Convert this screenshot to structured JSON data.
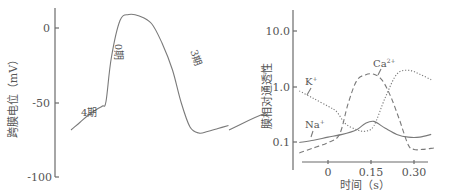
{
  "chart_data": [
    {
      "type": "line",
      "title": "",
      "xlabel": "",
      "ylabel": "跨膜电位（mV）",
      "ylim": [
        -100,
        10
      ],
      "yticks": [
        0,
        -50,
        -100
      ],
      "ytick_labels": [
        "0",
        "-50",
        "-100"
      ],
      "grid": false,
      "series": [
        {
          "name": "action-potential",
          "style": "solid",
          "x": [
            0,
            0.5,
            1,
            1.5,
            1.8,
            2.0,
            2.3,
            2.8,
            3.3,
            3.9,
            4.6,
            5.2,
            5.8,
            6.3,
            6.8,
            7.3,
            7.8,
            8.4,
            9.0
          ],
          "values": [
            -68,
            -63,
            -58,
            -54,
            -52,
            -49,
            -20,
            5,
            9,
            8,
            3,
            -10,
            -28,
            -50,
            -66,
            -70,
            -69,
            -67,
            -65
          ]
        }
      ],
      "annotations": [
        {
          "text": "4期",
          "near": "phase-4 diastolic depolarization"
        },
        {
          "text": "0期",
          "near": "phase-0 rapid upstroke",
          "rotated": true
        },
        {
          "text": "3期",
          "near": "phase-3 repolarization",
          "rotated": true
        }
      ]
    },
    {
      "type": "line",
      "title": "",
      "xlabel": "时间（s）",
      "ylabel": "膜相对通透性",
      "yscale": "log",
      "ylim": [
        0.05,
        20
      ],
      "yticks": [
        10.0,
        1.0,
        0.1
      ],
      "ytick_labels": [
        "10.0",
        "1.0",
        "0.1"
      ],
      "xlim": [
        -0.12,
        0.38
      ],
      "xticks": [
        0,
        0.15,
        0.3
      ],
      "xtick_labels": [
        "0",
        "0.15",
        "0.30"
      ],
      "grid": false,
      "series": [
        {
          "name": "K⁺",
          "style": "dotted",
          "x": [
            -0.1,
            -0.05,
            0.0,
            0.03,
            0.06,
            0.1,
            0.13,
            0.16,
            0.2,
            0.24,
            0.28,
            0.32,
            0.36
          ],
          "values": [
            0.85,
            0.62,
            0.45,
            0.36,
            0.22,
            0.17,
            0.16,
            0.2,
            0.65,
            1.7,
            2.0,
            1.7,
            1.35
          ]
        },
        {
          "name": "Na⁺",
          "style": "solid",
          "x": [
            -0.1,
            -0.05,
            0.0,
            0.05,
            0.1,
            0.13,
            0.16,
            0.2,
            0.24,
            0.28,
            0.32,
            0.36
          ],
          "values": [
            0.1,
            0.11,
            0.125,
            0.14,
            0.17,
            0.22,
            0.24,
            0.18,
            0.14,
            0.125,
            0.125,
            0.14
          ]
        },
        {
          "name": "Ca²⁺",
          "style": "dashed",
          "x": [
            -0.1,
            -0.05,
            0.0,
            0.04,
            0.07,
            0.1,
            0.13,
            0.16,
            0.19,
            0.22,
            0.25,
            0.28,
            0.3,
            0.33,
            0.37
          ],
          "values": [
            0.065,
            0.08,
            0.1,
            0.14,
            0.5,
            1.3,
            1.65,
            1.7,
            1.3,
            0.65,
            0.25,
            0.09,
            0.075,
            0.075,
            0.08
          ]
        }
      ],
      "legend": "inline-labels"
    }
  ],
  "labels": {
    "left_ylabel": "跨膜电位（mV）",
    "left_ticks": [
      "0",
      "-50",
      "-100"
    ],
    "phase4": "4期",
    "phase0": "0期",
    "phase3": "3期",
    "right_ylabel": "膜相对通透性",
    "right_yticks": [
      "10.0",
      "1.0",
      "0.1"
    ],
    "right_xticks": [
      "0",
      "0.15",
      "0.30"
    ],
    "right_xlabel": "时间（s）",
    "k_label": "K",
    "k_sup": "+",
    "na_label": "Na",
    "na_sup": "+",
    "ca_label": "Ca",
    "ca_sup": "2+"
  }
}
